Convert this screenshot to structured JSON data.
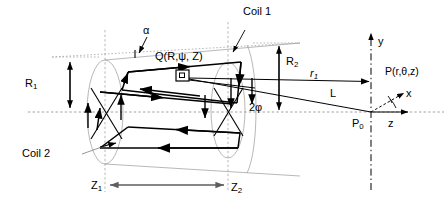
{
  "figure": {
    "kind": "technical-line-diagram",
    "background_color": "#ffffff",
    "ink_color": "#000000",
    "construction_line_color": "#9a9a9a",
    "axis_line_color": "#8c8c8c"
  },
  "labels": {
    "coil1": "Coil 1",
    "coil2": "Coil 2",
    "radius_inner": "R",
    "radius_inner_sub": "1",
    "radius_outer": "R",
    "radius_outer_sub": "2",
    "z_start": "Z",
    "z_start_sub": "1",
    "z_end": "Z",
    "z_end_sub": "2",
    "alpha": "α",
    "half_angle": "2φ",
    "source_point": "Q(R,ψ, Z)",
    "field_point": "P(r,θ,z)",
    "origin_point": "P",
    "origin_point_sub": "0",
    "vector_r1": "r",
    "vector_r1_sub": "1",
    "vector_L": "L",
    "axis_y": "y",
    "axis_x": "x",
    "axis_z": "z",
    "theta": "θ"
  },
  "geometry": {
    "left_ellipse": {
      "cx": 105,
      "cy": 112,
      "rx": 18,
      "ry": 52
    },
    "right_ellipse": {
      "cx": 228,
      "cy": 110,
      "rx": 17,
      "ry": 48
    },
    "axis_centerline_y": 112,
    "coord_origin": {
      "x": 371,
      "y": 112
    },
    "dimension_R1_x": 70,
    "dimension_R2_x": 279,
    "dimension_Z_y": 185
  }
}
